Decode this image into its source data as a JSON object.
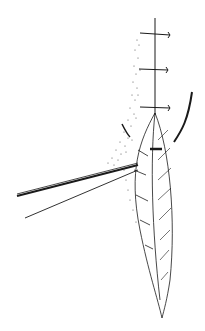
{
  "figure": {
    "kind": "surgical-line-drawing",
    "background": "#ffffff",
    "ink": "#1a1a1a",
    "elements": [
      "incision-line",
      "sutures",
      "retracted-tissue-flap",
      "forceps",
      "skin-stippling",
      "curved-needle"
    ],
    "suture_count": 3
  }
}
